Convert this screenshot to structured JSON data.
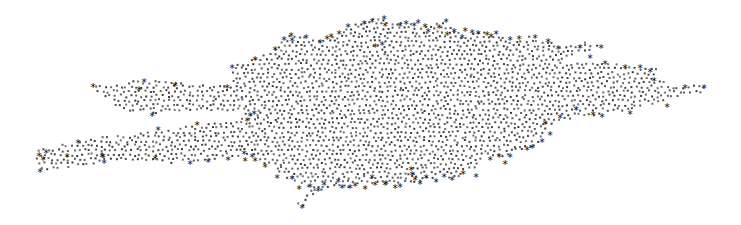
{
  "chart_data": {
    "type": "scatter",
    "title": "",
    "xlabel": "",
    "ylabel": "",
    "grid": false,
    "legend": null,
    "axes_visible": false,
    "xlim": [
      0,
      741
    ],
    "ylim": [
      225,
      0
    ],
    "background": "#ffffff",
    "point_color": "#2a2a2a",
    "star_color": "#1a1a1a",
    "point_size": 2,
    "point_spacing": 5.2,
    "outline": [
      [
        92,
        85
      ],
      [
        144,
        80
      ],
      [
        175,
        83
      ],
      [
        230,
        85
      ],
      [
        233,
        65
      ],
      [
        255,
        58
      ],
      [
        275,
        48
      ],
      [
        284,
        38
      ],
      [
        292,
        33
      ],
      [
        305,
        36
      ],
      [
        318,
        42
      ],
      [
        335,
        33
      ],
      [
        346,
        30
      ],
      [
        350,
        24
      ],
      [
        368,
        20
      ],
      [
        378,
        17
      ],
      [
        385,
        20
      ],
      [
        400,
        22
      ],
      [
        410,
        24
      ],
      [
        418,
        23
      ],
      [
        430,
        26
      ],
      [
        442,
        21
      ],
      [
        455,
        26
      ],
      [
        463,
        35
      ],
      [
        470,
        36
      ],
      [
        478,
        30
      ],
      [
        485,
        32
      ],
      [
        490,
        36
      ],
      [
        500,
        37
      ],
      [
        510,
        39
      ],
      [
        522,
        38
      ],
      [
        530,
        36
      ],
      [
        545,
        40
      ],
      [
        565,
        44
      ],
      [
        580,
        42
      ],
      [
        600,
        44
      ],
      [
        602,
        47
      ],
      [
        590,
        52
      ],
      [
        575,
        56
      ],
      [
        565,
        60
      ],
      [
        590,
        64
      ],
      [
        605,
        62
      ],
      [
        625,
        66
      ],
      [
        640,
        66
      ],
      [
        655,
        68
      ],
      [
        660,
        72
      ],
      [
        652,
        78
      ],
      [
        670,
        84
      ],
      [
        690,
        85
      ],
      [
        705,
        86
      ],
      [
        703,
        92
      ],
      [
        690,
        95
      ],
      [
        668,
        98
      ],
      [
        665,
        103
      ],
      [
        640,
        106
      ],
      [
        630,
        110
      ],
      [
        617,
        112
      ],
      [
        590,
        116
      ],
      [
        575,
        118
      ],
      [
        563,
        120
      ],
      [
        550,
        125
      ],
      [
        545,
        132
      ],
      [
        540,
        142
      ],
      [
        537,
        148
      ],
      [
        520,
        150
      ],
      [
        512,
        155
      ],
      [
        508,
        158
      ],
      [
        505,
        162
      ],
      [
        497,
        156
      ],
      [
        488,
        155
      ],
      [
        480,
        160
      ],
      [
        475,
        168
      ],
      [
        468,
        172
      ],
      [
        460,
        178
      ],
      [
        450,
        178
      ],
      [
        440,
        175
      ],
      [
        430,
        180
      ],
      [
        420,
        182
      ],
      [
        408,
        184
      ],
      [
        395,
        186
      ],
      [
        385,
        185
      ],
      [
        375,
        183
      ],
      [
        365,
        185
      ],
      [
        355,
        187
      ],
      [
        345,
        188
      ],
      [
        330,
        190
      ],
      [
        318,
        193
      ],
      [
        302,
        207
      ],
      [
        295,
        204
      ],
      [
        300,
        200
      ],
      [
        305,
        194
      ],
      [
        312,
        190
      ],
      [
        300,
        185
      ],
      [
        290,
        180
      ],
      [
        282,
        175
      ],
      [
        275,
        170
      ],
      [
        265,
        165
      ],
      [
        255,
        158
      ],
      [
        245,
        155
      ],
      [
        230,
        158
      ],
      [
        210,
        161
      ],
      [
        185,
        163
      ],
      [
        165,
        163
      ],
      [
        150,
        162
      ],
      [
        130,
        162
      ],
      [
        110,
        163
      ],
      [
        95,
        164
      ],
      [
        80,
        166
      ],
      [
        60,
        168
      ],
      [
        40,
        170
      ],
      [
        36,
        162
      ],
      [
        38,
        150
      ],
      [
        60,
        145
      ],
      [
        80,
        140
      ],
      [
        120,
        135
      ],
      [
        160,
        130
      ],
      [
        200,
        125
      ],
      [
        245,
        118
      ],
      [
        250,
        115
      ],
      [
        245,
        114
      ],
      [
        210,
        112
      ],
      [
        180,
        111
      ],
      [
        165,
        114
      ],
      [
        152,
        115
      ],
      [
        135,
        112
      ],
      [
        120,
        108
      ],
      [
        105,
        100
      ],
      [
        96,
        92
      ]
    ],
    "star_markers": [
      [
        93,
        85
      ],
      [
        144,
        80
      ],
      [
        139,
        88
      ],
      [
        152,
        114
      ],
      [
        175,
        84
      ],
      [
        227,
        86
      ],
      [
        232,
        66
      ],
      [
        255,
        58
      ],
      [
        275,
        48
      ],
      [
        284,
        38
      ],
      [
        291,
        34
      ],
      [
        292,
        39
      ],
      [
        306,
        36
      ],
      [
        320,
        41
      ],
      [
        327,
        37
      ],
      [
        331,
        35
      ],
      [
        339,
        32
      ],
      [
        348,
        25
      ],
      [
        364,
        22
      ],
      [
        372,
        20
      ],
      [
        384,
        17
      ],
      [
        385,
        24
      ],
      [
        375,
        45
      ],
      [
        382,
        43
      ],
      [
        400,
        24
      ],
      [
        406,
        22
      ],
      [
        414,
        24
      ],
      [
        418,
        21
      ],
      [
        425,
        25
      ],
      [
        428,
        30
      ],
      [
        439,
        26
      ],
      [
        446,
        20
      ],
      [
        447,
        33
      ],
      [
        454,
        30
      ],
      [
        462,
        36
      ],
      [
        465,
        29
      ],
      [
        472,
        31
      ],
      [
        478,
        32
      ],
      [
        487,
        33
      ],
      [
        491,
        35
      ],
      [
        496,
        32
      ],
      [
        510,
        38
      ],
      [
        519,
        37
      ],
      [
        535,
        36
      ],
      [
        548,
        40
      ],
      [
        558,
        47
      ],
      [
        580,
        46
      ],
      [
        601,
        46
      ],
      [
        590,
        56
      ],
      [
        605,
        62
      ],
      [
        625,
        66
      ],
      [
        640,
        66
      ],
      [
        650,
        70
      ],
      [
        654,
        79
      ],
      [
        685,
        86
      ],
      [
        704,
        86
      ],
      [
        667,
        105
      ],
      [
        630,
        112
      ],
      [
        602,
        115
      ],
      [
        593,
        113
      ],
      [
        576,
        108
      ],
      [
        560,
        116
      ],
      [
        545,
        122
      ],
      [
        550,
        133
      ],
      [
        542,
        140
      ],
      [
        532,
        146
      ],
      [
        527,
        148
      ],
      [
        510,
        155
      ],
      [
        505,
        162
      ],
      [
        499,
        155
      ],
      [
        490,
        158
      ],
      [
        476,
        175
      ],
      [
        463,
        172
      ],
      [
        452,
        178
      ],
      [
        444,
        175
      ],
      [
        436,
        180
      ],
      [
        426,
        176
      ],
      [
        420,
        182
      ],
      [
        415,
        178
      ],
      [
        412,
        173
      ],
      [
        411,
        168
      ],
      [
        400,
        185
      ],
      [
        395,
        186
      ],
      [
        386,
        182
      ],
      [
        385,
        183
      ],
      [
        375,
        183
      ],
      [
        372,
        176
      ],
      [
        365,
        187
      ],
      [
        355,
        184
      ],
      [
        350,
        186
      ],
      [
        342,
        186
      ],
      [
        338,
        180
      ],
      [
        324,
        183
      ],
      [
        318,
        189
      ],
      [
        310,
        185
      ],
      [
        302,
        206
      ],
      [
        299,
        187
      ],
      [
        292,
        177
      ],
      [
        277,
        176
      ],
      [
        265,
        165
      ],
      [
        255,
        159
      ],
      [
        252,
        155
      ],
      [
        245,
        159
      ],
      [
        244,
        152
      ],
      [
        228,
        158
      ],
      [
        208,
        160
      ],
      [
        190,
        162
      ],
      [
        155,
        157
      ],
      [
        104,
        161
      ],
      [
        103,
        155
      ],
      [
        102,
        155
      ],
      [
        78,
        141
      ],
      [
        67,
        155
      ],
      [
        46,
        151
      ],
      [
        43,
        158
      ],
      [
        39,
        154
      ],
      [
        40,
        170
      ],
      [
        158,
        128
      ],
      [
        197,
        123
      ],
      [
        247,
        119
      ],
      [
        250,
        114
      ],
      [
        254,
        112
      ]
    ]
  }
}
